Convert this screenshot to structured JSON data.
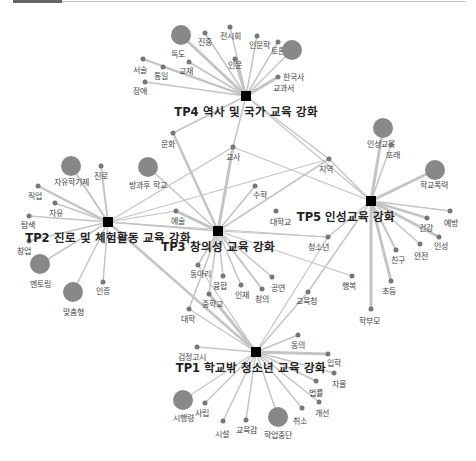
{
  "hubs": [
    {
      "id": "TP4",
      "label": "TP4 역사 및 국가 교육 강화",
      "x": 246,
      "y": 96,
      "lx": 246,
      "ly": 116
    },
    {
      "id": "TP2",
      "label": "TP2 진로 및 체험활동 교육 강화",
      "x": 108,
      "y": 222,
      "lx": 108,
      "ly": 242
    },
    {
      "id": "TP3",
      "label": "TP3 창의성 교육 강화",
      "x": 218,
      "y": 231,
      "lx": 218,
      "ly": 251
    },
    {
      "id": "TP5",
      "label": "TP5 인성교육 강화",
      "x": 371,
      "y": 201,
      "lx": 346,
      "ly": 221
    },
    {
      "id": "TP1",
      "label": "TP1 학교밖 청소년 교육 강화",
      "x": 256,
      "y": 352,
      "lx": 251,
      "ly": 372
    }
  ],
  "nodes": [
    {
      "label": "독도",
      "x": 181,
      "y": 35,
      "r": 10,
      "lx": 178,
      "ly": 57
    },
    {
      "label": "진흥",
      "x": 205,
      "y": 33,
      "r": 2.5,
      "lx": 205,
      "ly": 45
    },
    {
      "label": "전시회",
      "x": 230,
      "y": 27,
      "r": 2.5,
      "lx": 230,
      "ly": 39
    },
    {
      "label": "인문학",
      "x": 257,
      "y": 36,
      "r": 2.5,
      "lx": 259,
      "ly": 48
    },
    {
      "label": "토론",
      "x": 278,
      "y": 42,
      "r": 2.5,
      "lx": 278,
      "ly": 54
    },
    {
      "label": "인문",
      "x": 235,
      "y": 59,
      "r": 2.5,
      "lx": 235,
      "ly": 68
    },
    {
      "label": "교재",
      "x": 189,
      "y": 62,
      "r": 2.5,
      "lx": 186,
      "ly": 74
    },
    {
      "label": "통일",
      "x": 163,
      "y": 67,
      "r": 2.5,
      "lx": 161,
      "ly": 79
    },
    {
      "label": "서술",
      "x": 143,
      "y": 59,
      "r": 2.5,
      "lx": 140,
      "ly": 73
    },
    {
      "label": "장애",
      "x": 145,
      "y": 82,
      "r": 2.5,
      "lx": 140,
      "ly": 94
    },
    {
      "label": "한국사",
      "x": 278,
      "y": 77,
      "r": 2.5,
      "lx": 293,
      "ly": 80
    },
    {
      "label": "교과서",
      "x": 292,
      "y": 50,
      "r": 10,
      "lx": 283,
      "ly": 91
    },
    {
      "label": "자유학기제",
      "x": 71,
      "y": 166,
      "r": 10,
      "lx": 71,
      "ly": 185
    },
    {
      "label": "진로",
      "x": 101,
      "y": 166,
      "r": 2.5,
      "lx": 101,
      "ly": 179
    },
    {
      "label": "직업",
      "x": 38,
      "y": 186,
      "r": 2.5,
      "lx": 35,
      "ly": 199
    },
    {
      "label": "자유",
      "x": 55,
      "y": 203,
      "r": 2.5,
      "lx": 56,
      "ly": 216
    },
    {
      "label": "탐색",
      "x": 29,
      "y": 216,
      "r": 2.5,
      "lx": 28,
      "ly": 228
    },
    {
      "label": "창업",
      "x": 29,
      "y": 241,
      "r": 2.5,
      "lx": 24,
      "ly": 254
    },
    {
      "label": "멘토링",
      "x": 40,
      "y": 264,
      "r": 10,
      "lx": 40,
      "ly": 287
    },
    {
      "label": "맞춤형",
      "x": 73,
      "y": 292,
      "r": 10,
      "lx": 73,
      "ly": 315
    },
    {
      "label": "인증",
      "x": 103,
      "y": 282,
      "r": 2.5,
      "lx": 103,
      "ly": 294
    },
    {
      "label": "방과후 학교",
      "x": 148,
      "y": 167,
      "r": 10,
      "lx": 148,
      "ly": 188
    },
    {
      "label": "문화",
      "x": 173,
      "y": 133,
      "r": 2.5,
      "lx": 168,
      "ly": 147
    },
    {
      "label": "교사",
      "x": 233,
      "y": 147,
      "r": 2.5,
      "lx": 233,
      "ly": 160
    },
    {
      "label": "지역",
      "x": 329,
      "y": 159,
      "r": 2.5,
      "lx": 326,
      "ly": 172
    },
    {
      "label": "수학",
      "x": 255,
      "y": 186,
      "r": 2.5,
      "lx": 260,
      "ly": 198
    },
    {
      "label": "대학교",
      "x": 276,
      "y": 211,
      "r": 2.5,
      "lx": 280,
      "ly": 225
    },
    {
      "label": "예술",
      "x": 176,
      "y": 211,
      "r": 2.5,
      "lx": 178,
      "ly": 224
    },
    {
      "label": "청소년",
      "x": 328,
      "y": 237,
      "r": 2.5,
      "lx": 318,
      "ly": 250
    },
    {
      "label": "동아리",
      "x": 198,
      "y": 265,
      "r": 2.5,
      "lx": 200,
      "ly": 277
    },
    {
      "label": "융합",
      "x": 223,
      "y": 276,
      "r": 2.5,
      "lx": 220,
      "ly": 289
    },
    {
      "label": "인재",
      "x": 241,
      "y": 285,
      "r": 2.5,
      "lx": 242,
      "ly": 298
    },
    {
      "label": "공연",
      "x": 272,
      "y": 277,
      "r": 2.5,
      "lx": 278,
      "ly": 291
    },
    {
      "label": "창의",
      "x": 262,
      "y": 289,
      "r": 2.5,
      "lx": 262,
      "ly": 302
    },
    {
      "label": "중학교",
      "x": 209,
      "y": 294,
      "r": 2.5,
      "lx": 212,
      "ly": 307
    },
    {
      "label": "대학",
      "x": 189,
      "y": 309,
      "r": 2.5,
      "lx": 188,
      "ly": 322
    },
    {
      "label": "교육청",
      "x": 308,
      "y": 292,
      "r": 2.5,
      "lx": 306,
      "ly": 304
    },
    {
      "label": "인성교육",
      "x": 383,
      "y": 128,
      "r": 10,
      "lx": 381,
      "ly": 147
    },
    {
      "label": "또래",
      "x": 391,
      "y": 145,
      "r": 2.5,
      "lx": 393,
      "ly": 158
    },
    {
      "label": "학교폭력",
      "x": 435,
      "y": 170,
      "r": 10,
      "lx": 434,
      "ly": 188
    },
    {
      "label": "건강",
      "x": 427,
      "y": 218,
      "r": 2.5,
      "lx": 426,
      "ly": 231
    },
    {
      "label": "예방",
      "x": 450,
      "y": 211,
      "r": 2.5,
      "lx": 451,
      "ly": 226
    },
    {
      "label": "인성",
      "x": 439,
      "y": 237,
      "r": 2.5,
      "lx": 441,
      "ly": 249
    },
    {
      "label": "안전",
      "x": 420,
      "y": 244,
      "r": 2.5,
      "lx": 421,
      "ly": 259
    },
    {
      "label": "친구",
      "x": 396,
      "y": 250,
      "r": 2.5,
      "lx": 398,
      "ly": 263
    },
    {
      "label": "초등",
      "x": 391,
      "y": 281,
      "r": 2.5,
      "lx": 389,
      "ly": 294
    },
    {
      "label": "행복",
      "x": 352,
      "y": 276,
      "r": 2.5,
      "lx": 349,
      "ly": 289
    },
    {
      "label": "학부모",
      "x": 371,
      "y": 309,
      "r": 2.5,
      "lx": 369,
      "ly": 324
    },
    {
      "label": "동의",
      "x": 298,
      "y": 335,
      "r": 2.5,
      "lx": 298,
      "ly": 348
    },
    {
      "label": "입학",
      "x": 328,
      "y": 354,
      "r": 2.5,
      "lx": 334,
      "ly": 366
    },
    {
      "label": "자율",
      "x": 334,
      "y": 373,
      "r": 2.5,
      "lx": 339,
      "ly": 387
    },
    {
      "label": "법률",
      "x": 316,
      "y": 381,
      "r": 2.5,
      "lx": 316,
      "ly": 396
    },
    {
      "label": "개선",
      "x": 319,
      "y": 402,
      "r": 2.5,
      "lx": 322,
      "ly": 416
    },
    {
      "label": "취소",
      "x": 302,
      "y": 408,
      "r": 2.5,
      "lx": 300,
      "ly": 424
    },
    {
      "label": "학업중단",
      "x": 278,
      "y": 417,
      "r": 10,
      "lx": 278,
      "ly": 438
    },
    {
      "label": "교육감",
      "x": 246,
      "y": 420,
      "r": 2.5,
      "lx": 246,
      "ly": 433
    },
    {
      "label": "시설",
      "x": 223,
      "y": 421,
      "r": 2.5,
      "lx": 222,
      "ly": 437
    },
    {
      "label": "사립",
      "x": 205,
      "y": 403,
      "r": 2.5,
      "lx": 202,
      "ly": 416
    },
    {
      "label": "시행령",
      "x": 183,
      "y": 400,
      "r": 10,
      "lx": 183,
      "ly": 421
    },
    {
      "label": "검정고시",
      "x": 197,
      "y": 347,
      "r": 2.5,
      "lx": 192,
      "ly": 360
    }
  ],
  "edges": [
    [
      "TP4",
      "독도",
      3
    ],
    [
      "TP4",
      "진흥",
      1.5
    ],
    [
      "TP4",
      "전시회",
      1.5
    ],
    [
      "TP4",
      "인문학",
      1.5
    ],
    [
      "TP4",
      "토론",
      1.5
    ],
    [
      "TP4",
      "인문",
      3
    ],
    [
      "TP4",
      "교재",
      2
    ],
    [
      "TP4",
      "통일",
      1.5
    ],
    [
      "TP4",
      "서술",
      2
    ],
    [
      "TP4",
      "장애",
      1.5
    ],
    [
      "TP4",
      "한국사",
      3
    ],
    [
      "TP4",
      "교과서",
      1.5
    ],
    [
      "TP4",
      "문화",
      1.5
    ],
    [
      "TP4",
      "교사",
      1.5
    ],
    [
      "TP4",
      "지역",
      1.5
    ],
    [
      "TP4",
      "TP5",
      1.2
    ],
    [
      "TP2",
      "자유학기제",
      2
    ],
    [
      "TP2",
      "진로",
      2
    ],
    [
      "TP2",
      "직업",
      2.5
    ],
    [
      "TP2",
      "자유",
      1.5
    ],
    [
      "TP2",
      "탐색",
      1.5
    ],
    [
      "TP2",
      "창업",
      1.5
    ],
    [
      "TP2",
      "멘토링",
      1.5
    ],
    [
      "TP2",
      "맞춤형",
      1.5
    ],
    [
      "TP2",
      "인증",
      1.5
    ],
    [
      "TP2",
      "교사",
      1.2
    ],
    [
      "TP2",
      "지역",
      1.2
    ],
    [
      "TP2",
      "예술",
      1.2
    ],
    [
      "TP2",
      "TP3",
      1.5
    ],
    [
      "TP2",
      "TP1",
      2.5
    ],
    [
      "TP2",
      "청소년",
      1.2
    ],
    [
      "TP3",
      "문화",
      2.5
    ],
    [
      "TP3",
      "교사",
      3
    ],
    [
      "TP3",
      "방과후 학교",
      1.5
    ],
    [
      "TP3",
      "수학",
      1.5
    ],
    [
      "TP3",
      "지역",
      1.5
    ],
    [
      "TP3",
      "예술",
      3
    ],
    [
      "TP3",
      "청소년",
      1.2
    ],
    [
      "TP3",
      "동아리",
      1.5
    ],
    [
      "TP3",
      "융합",
      1.5
    ],
    [
      "TP3",
      "인재",
      1.5
    ],
    [
      "TP3",
      "공연",
      1.5
    ],
    [
      "TP3",
      "창의",
      2
    ],
    [
      "TP3",
      "중학교",
      1.5
    ],
    [
      "TP3",
      "대학",
      1.5
    ],
    [
      "TP3",
      "행복",
      1.2
    ],
    [
      "TP5",
      "인성교육",
      3
    ],
    [
      "TP5",
      "또래",
      1.5
    ],
    [
      "TP5",
      "학교폭력",
      3
    ],
    [
      "TP5",
      "건강",
      2.5
    ],
    [
      "TP5",
      "예방",
      1.5
    ],
    [
      "TP5",
      "인성",
      3
    ],
    [
      "TP5",
      "안전",
      1.5
    ],
    [
      "TP5",
      "친구",
      2
    ],
    [
      "TP5",
      "초등",
      3
    ],
    [
      "TP5",
      "학부모",
      3
    ],
    [
      "TP5",
      "지역",
      1.5
    ],
    [
      "TP5",
      "교사",
      1.2
    ],
    [
      "TP5",
      "교육청",
      1.5
    ],
    [
      "TP5",
      "청소년",
      1.5
    ],
    [
      "TP1",
      "중학교",
      3
    ],
    [
      "TP1",
      "대학",
      1.2
    ],
    [
      "TP1",
      "교육청",
      1.5
    ],
    [
      "TP1",
      "동의",
      1.5
    ],
    [
      "TP1",
      "입학",
      3
    ],
    [
      "TP1",
      "자율",
      1.5
    ],
    [
      "TP1",
      "법률",
      1.5
    ],
    [
      "TP1",
      "개선",
      1.5
    ],
    [
      "TP1",
      "취소",
      1.5
    ],
    [
      "TP1",
      "학업중단",
      1.5
    ],
    [
      "TP1",
      "교육감",
      1.5
    ],
    [
      "TP1",
      "시설",
      1.5
    ],
    [
      "TP1",
      "사립",
      1.5
    ],
    [
      "TP1",
      "시행령",
      1.2
    ],
    [
      "TP1",
      "검정고시",
      1.5
    ],
    [
      "TP1",
      "동아리",
      1.2
    ],
    [
      "TP1",
      "청소년",
      1.2
    ]
  ],
  "style": {
    "edge_color": "#c4c4c4",
    "node_color": "#777777",
    "big_node_color": "#888888",
    "hub_color": "#000000"
  }
}
